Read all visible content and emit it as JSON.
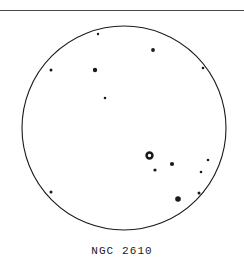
{
  "figure": {
    "caption": "NGC 2610",
    "object_name": "NGC 2610",
    "kind": "eyepiece-sketch",
    "colors": {
      "ink": "#1a1a1a",
      "rule": "#4a4a4a",
      "background": "#ffffff"
    },
    "rule": {
      "name": "top-horizontal-rule",
      "x": 0,
      "y": 10,
      "width": 244,
      "height": 1
    },
    "field_of_view": {
      "name": "eyepiece-field-circle",
      "cx": 124,
      "cy": 128,
      "r": 102,
      "stroke_width": 1.1
    },
    "nebula": {
      "name": "planetary-nebula-ngc-2610",
      "cx": 149.5,
      "cy": 155.5,
      "outer_r": 4.2,
      "inner_r": 1.7,
      "label": "NGC 2610"
    },
    "stars": [
      {
        "id": "star-1",
        "cx": 98,
        "cy": 34,
        "r": 1.2
      },
      {
        "id": "star-2",
        "cx": 153,
        "cy": 50,
        "r": 1.9
      },
      {
        "id": "star-3",
        "cx": 51,
        "cy": 70,
        "r": 1.5
      },
      {
        "id": "star-4",
        "cx": 95,
        "cy": 70,
        "r": 2.2
      },
      {
        "id": "star-5",
        "cx": 203,
        "cy": 68,
        "r": 1.3
      },
      {
        "id": "star-6",
        "cx": 105,
        "cy": 98,
        "r": 1.3
      },
      {
        "id": "star-7",
        "cx": 172,
        "cy": 164,
        "r": 2.1
      },
      {
        "id": "star-8",
        "cx": 155,
        "cy": 170,
        "r": 1.6
      },
      {
        "id": "star-9",
        "cx": 208,
        "cy": 160,
        "r": 1.3
      },
      {
        "id": "star-10",
        "cx": 201,
        "cy": 172,
        "r": 1.3
      },
      {
        "id": "star-11",
        "cx": 199,
        "cy": 193,
        "r": 1.5
      },
      {
        "id": "star-12",
        "cx": 178,
        "cy": 199,
        "r": 2.8
      },
      {
        "id": "star-13",
        "cx": 51,
        "cy": 192,
        "r": 1.5
      }
    ]
  }
}
